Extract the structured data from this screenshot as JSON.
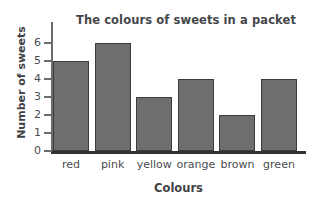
{
  "chart_data": {
    "type": "bar",
    "title": "The colours of sweets in a packet",
    "xlabel": "Colours",
    "ylabel": "Number of sweets",
    "categories": [
      "red",
      "pink",
      "yellow",
      "orange",
      "brown",
      "green"
    ],
    "values": [
      5,
      6,
      3,
      4,
      2,
      4
    ],
    "ylim": [
      0,
      6
    ],
    "yticks": [
      0,
      1,
      2,
      3,
      4,
      5,
      6
    ],
    "ytick_labels": [
      "0",
      "1",
      "2",
      "3",
      "4",
      "5",
      "6"
    ],
    "grid": false,
    "legend": null,
    "colors": {
      "bar_fill": "#6e6e6e",
      "bar_outline": "#3c3c3c",
      "axis": "#2f3133",
      "text": "#45474a",
      "background": "#ffffff"
    }
  }
}
